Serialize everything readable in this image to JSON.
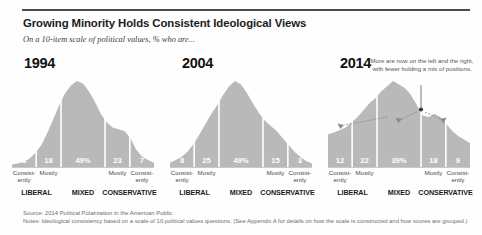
{
  "header": {
    "title": "Growing Minority Holds Consistent Ideological Views",
    "subtitle": "On a 10-item scale of political values, % who are..."
  },
  "category_labels": {
    "consistently_liberal": "Consist-\nently",
    "mostly_liberal": "Mostly",
    "mixed": "",
    "mostly_conservative": "Mostly",
    "consistently_conservative": "Consist-\nently"
  },
  "group_labels": {
    "liberal": "LIBERAL",
    "mixed": "MIXED",
    "conservative": "CONSERVATIVE"
  },
  "annotation": {
    "text": "More are now on the left and the right, with fewer holding a mix of positions."
  },
  "footer": {
    "source": "Source: 2014 Political Polarization in the American Public",
    "notes": "Notes: Ideological consistency based on a scale of 10 political values questions. (See Appendix A for details on how the scale is constructed and how scores are grouped.)"
  },
  "colors": {
    "curve_fill": "#b9b9b9",
    "divider": "#ffffff",
    "title": "#1b1b1b",
    "footnote": "#6c6d70"
  },
  "chart_data": {
    "type": "area",
    "title": "Growing Minority Holds Consistent Ideological Views",
    "subtitle": "On a 10-item scale of political values, % who are...",
    "xlabel": "",
    "ylabel": "% of respondents",
    "categories": [
      "Consistently liberal",
      "Mostly liberal",
      "Mixed",
      "Mostly conservative",
      "Consistently conservative"
    ],
    "series": [
      {
        "name": "1994",
        "values": [
          3,
          18,
          49,
          23,
          7
        ],
        "labels": [
          "3",
          "18",
          "49%",
          "23",
          "7"
        ]
      },
      {
        "name": "2004",
        "values": [
          8,
          25,
          49,
          15,
          3
        ],
        "labels": [
          "8",
          "25",
          "49%",
          "15",
          "3"
        ]
      },
      {
        "name": "2014",
        "values": [
          12,
          22,
          39,
          18,
          9
        ],
        "labels": [
          "12",
          "22",
          "39%",
          "18",
          "9"
        ]
      }
    ],
    "panels": [
      {
        "year": "1994",
        "values": [
          3,
          18,
          49,
          23,
          7
        ],
        "labels": [
          "3",
          "18",
          "49%",
          "23",
          "7"
        ],
        "shape": [
          3,
          4,
          6,
          10,
          17,
          26,
          40,
          56,
          72,
          86,
          95,
          100,
          97,
          88,
          76,
          62,
          52,
          46,
          44,
          42,
          34,
          20,
          12,
          8,
          5
        ]
      },
      {
        "year": "2004",
        "values": [
          8,
          25,
          49,
          15,
          3
        ],
        "labels": [
          "8",
          "25",
          "49%",
          "15",
          "3"
        ],
        "shape": [
          5,
          8,
          12,
          18,
          27,
          38,
          50,
          62,
          72,
          84,
          94,
          100,
          96,
          86,
          74,
          63,
          54,
          48,
          42,
          34,
          26,
          18,
          12,
          7,
          4
        ]
      },
      {
        "year": "2014",
        "values": [
          12,
          22,
          39,
          18,
          9
        ],
        "labels": [
          "12",
          "22",
          "39%",
          "18",
          "9"
        ],
        "shape": [
          38,
          40,
          43,
          46,
          52,
          58,
          66,
          74,
          80,
          88,
          94,
          100,
          96,
          92,
          84,
          72,
          60,
          58,
          62,
          58,
          50,
          42,
          36,
          32,
          28
        ],
        "annotation": "More are now on the left and the right, with fewer holding a mix of positions."
      }
    ],
    "legend_position": "none",
    "grid": false
  }
}
